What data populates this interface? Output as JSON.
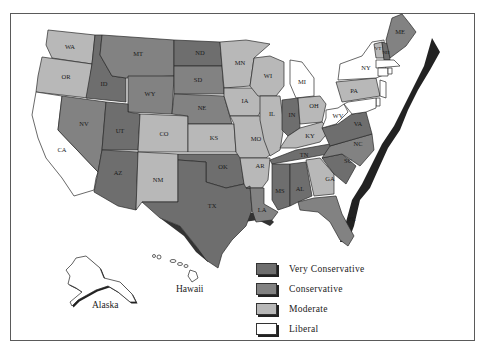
{
  "map": {
    "title": "",
    "colors": {
      "very_conservative": "#6e6e6e",
      "conservative": "#828282",
      "moderate": "#b8b8b8",
      "liberal": "#ffffff"
    },
    "states": {
      "WA": "moderate",
      "OR": "moderate",
      "CA": "liberal",
      "ID": "very_conservative",
      "NV": "conservative",
      "MT": "conservative",
      "WY": "conservative",
      "UT": "very_conservative",
      "AZ": "very_conservative",
      "CO": "moderate",
      "NM": "moderate",
      "ND": "very_conservative",
      "SD": "conservative",
      "NE": "conservative",
      "KS": "moderate",
      "OK": "very_conservative",
      "TX": "very_conservative",
      "MN": "moderate",
      "IA": "moderate",
      "MO": "moderate",
      "AR": "moderate",
      "LA": "conservative",
      "WI": "moderate",
      "IL": "moderate",
      "MI": "liberal",
      "IN": "very_conservative",
      "OH": "moderate",
      "KY": "moderate",
      "TN": "very_conservative",
      "MS": "very_conservative",
      "AL": "very_conservative",
      "GA": "moderate",
      "FL": "conservative",
      "SC": "very_conservative",
      "NC": "conservative",
      "VA": "very_conservative",
      "WV": "liberal",
      "PA": "moderate",
      "NY": "liberal",
      "VT": "moderate",
      "NH": "very_conservative",
      "ME": "conservative",
      "MA": "liberal",
      "CT": "liberal",
      "RI": "liberal",
      "NJ": "liberal",
      "DE": "liberal",
      "MD": "liberal"
    },
    "labels": {
      "WA": "WA",
      "OR": "OR",
      "CA": "CA",
      "ID": "ID",
      "NV": "NV",
      "MT": "MT",
      "WY": "WY",
      "UT": "UT",
      "AZ": "AZ",
      "CO": "CO",
      "NM": "NM",
      "ND": "ND",
      "SD": "SD",
      "NE": "NE",
      "KS": "KS",
      "OK": "OK",
      "TX": "TX",
      "MN": "MN",
      "IA": "IA",
      "MO": "MO",
      "AR": "AR",
      "LA": "LA",
      "WI": "WI",
      "IL": "IL",
      "MI": "MI",
      "IN": "IN",
      "OH": "OH",
      "KY": "KY",
      "TN": "TN",
      "MS": "MS",
      "AL": "AL",
      "GA": "GA",
      "FL": "FL",
      "SC": "SC",
      "NC": "NC",
      "VA": "VA",
      "WV": "WV",
      "PA": "PA",
      "NY": "NY",
      "VT": "VT",
      "NH": "NH",
      "ME": "ME"
    },
    "insets": {
      "alaska": "Alaska",
      "hawaii": "Hawaii"
    }
  },
  "legend": {
    "items": [
      {
        "key": "very_conservative",
        "label": "Very Conservative",
        "color": "#6e6e6e"
      },
      {
        "key": "conservative",
        "label": "Conservative",
        "color": "#828282"
      },
      {
        "key": "moderate",
        "label": "Moderate",
        "color": "#b8b8b8"
      },
      {
        "key": "liberal",
        "label": "Liberal",
        "color": "#ffffff"
      }
    ]
  }
}
